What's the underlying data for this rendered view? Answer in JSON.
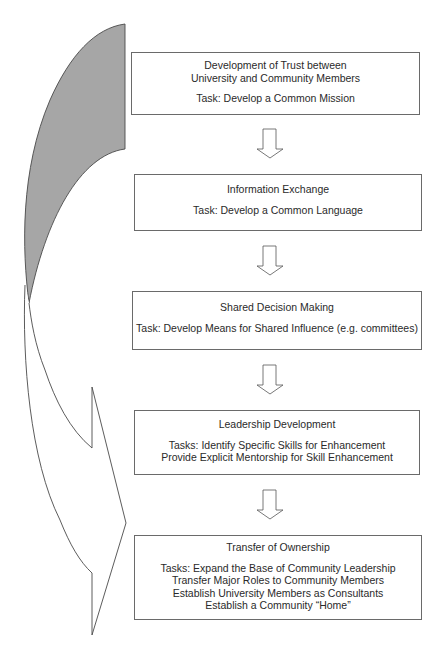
{
  "diagram": {
    "type": "process-flow",
    "stages": [
      {
        "title_lines": [
          "Development of Trust between",
          "University and Community Members"
        ],
        "task_lines": [
          "Task:  Develop a Common Mission"
        ]
      },
      {
        "title_lines": [
          "Information Exchange"
        ],
        "task_lines": [
          "Task: Develop a Common Language"
        ]
      },
      {
        "title_lines": [
          "Shared Decision Making"
        ],
        "task_lines": [
          "Task: Develop Means for Shared Influence (e.g. committees)"
        ]
      },
      {
        "title_lines": [
          "Leadership Development"
        ],
        "task_lines": [
          "Tasks: Identify Specific Skills for Enhancement",
          "Provide Explicit Mentorship for Skill Enhancement"
        ]
      },
      {
        "title_lines": [
          "Transfer of Ownership"
        ],
        "task_lines": [
          "Tasks:  Expand the Base of Community Leadership",
          "Transfer Major Roles to Community  Members",
          "Establish University Members as Consultants",
          "Establish a Community “Home”"
        ]
      }
    ],
    "connectors": [
      "down-arrow",
      "down-arrow",
      "down-arrow",
      "down-arrow"
    ],
    "side_graphic": {
      "shape": "curved-arrow",
      "shaded_color": "#a6a6a6",
      "outline_color": "#4a4a4a",
      "fill_color": "#ffffff"
    }
  }
}
